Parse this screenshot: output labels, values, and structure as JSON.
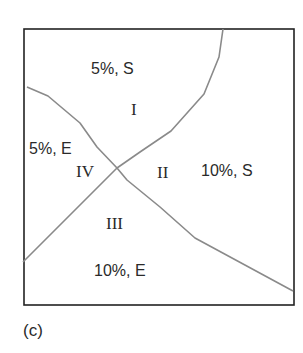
{
  "figure": {
    "caption": "(c)",
    "colors": {
      "frame": "#222222",
      "curve": "#8a8a8a",
      "text": "#2a2a2a",
      "background": "#ffffff"
    }
  },
  "regions": {
    "top": {
      "label": "5%, S",
      "numeral": "I"
    },
    "right": {
      "label": "10%, S",
      "numeral": "II"
    },
    "bottom": {
      "label": "10%, E",
      "numeral": "III"
    },
    "left": {
      "label": "5%, E",
      "numeral": "IV"
    }
  },
  "curves": {
    "ascending": {
      "name": "boundary-ascending",
      "points": [
        [
          23,
          262
        ],
        [
          117,
          168
        ],
        [
          140,
          152
        ],
        [
          171,
          131
        ],
        [
          204,
          94
        ],
        [
          219,
          57
        ],
        [
          223,
          29
        ]
      ]
    },
    "descending": {
      "name": "boundary-descending",
      "points": [
        [
          27,
          87
        ],
        [
          48,
          96
        ],
        [
          80,
          123
        ],
        [
          97,
          147
        ],
        [
          117,
          168
        ],
        [
          127,
          180
        ],
        [
          160,
          207
        ],
        [
          195,
          238
        ],
        [
          293,
          291
        ]
      ]
    }
  },
  "frame": {
    "x": 24,
    "y": 29,
    "width": 270,
    "height": 276
  }
}
